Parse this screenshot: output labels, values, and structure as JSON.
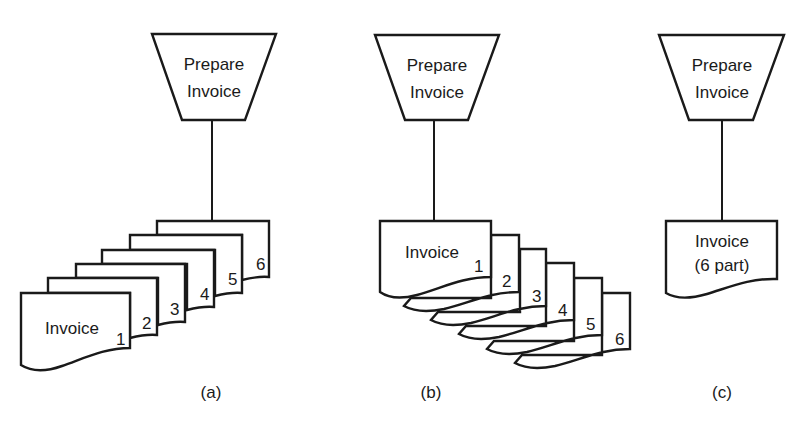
{
  "diagrams": [
    {
      "id": "a",
      "caption": "(a)",
      "process": {
        "line1": "Prepare",
        "line2": "Invoice"
      },
      "documents": {
        "front_label": "Invoice",
        "copies": [
          "1",
          "2",
          "3",
          "4",
          "5",
          "6"
        ]
      }
    },
    {
      "id": "b",
      "caption": "(b)",
      "process": {
        "line1": "Prepare",
        "line2": "Invoice"
      },
      "documents": {
        "front_label": "Invoice",
        "copies": [
          "1",
          "2",
          "3",
          "4",
          "5",
          "6"
        ]
      }
    },
    {
      "id": "c",
      "caption": "(c)",
      "process": {
        "line1": "Prepare",
        "line2": "Invoice"
      },
      "documents": {
        "front_label": "Invoice",
        "sub_label": "(6 part)"
      }
    }
  ],
  "colors": {
    "stroke": "#1a1a1a",
    "background": "#ffffff"
  }
}
